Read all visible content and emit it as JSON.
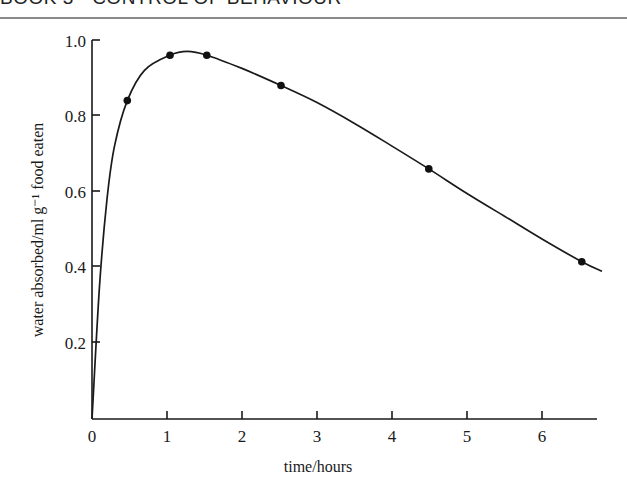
{
  "header": {
    "running_title": "BOOK 3 · CONTROL OF BEHAVIOUR"
  },
  "chart_data": {
    "type": "line",
    "title": "",
    "xlabel": "time/hours",
    "ylabel": "water absorbed/ml g⁻¹ food eaten",
    "xlim": [
      0,
      6.8
    ],
    "ylim": [
      0,
      1.0
    ],
    "x_ticks": [
      "0",
      "1",
      "2",
      "3",
      "4",
      "5",
      "6"
    ],
    "y_ticks": [
      "0.2",
      "0.4",
      "0.6",
      "0.8",
      "1.0"
    ],
    "grid": false,
    "legend": null,
    "series": [
      {
        "name": "water absorbed",
        "markers": true,
        "x": [
          0.47,
          1.04,
          1.53,
          2.52,
          4.49,
          6.53
        ],
        "y": [
          0.84,
          0.96,
          0.96,
          0.88,
          0.66,
          0.415
        ]
      }
    ],
    "fitted_curve": {
      "description": "smooth curve rising steeply from origin (0,0), peaking ~0.97 at ~1.3 h, then declining almost linearly to ~0.39 at 6.8 h",
      "x": [
        0,
        0.1,
        0.2,
        0.3,
        0.47,
        0.7,
        1.04,
        1.27,
        1.53,
        2.0,
        2.52,
        3.0,
        3.5,
        4.0,
        4.49,
        5.0,
        5.5,
        6.0,
        6.53,
        6.8
      ],
      "y": [
        0,
        0.35,
        0.58,
        0.72,
        0.84,
        0.92,
        0.96,
        0.97,
        0.96,
        0.925,
        0.88,
        0.835,
        0.78,
        0.72,
        0.66,
        0.595,
        0.535,
        0.475,
        0.415,
        0.39
      ]
    }
  }
}
